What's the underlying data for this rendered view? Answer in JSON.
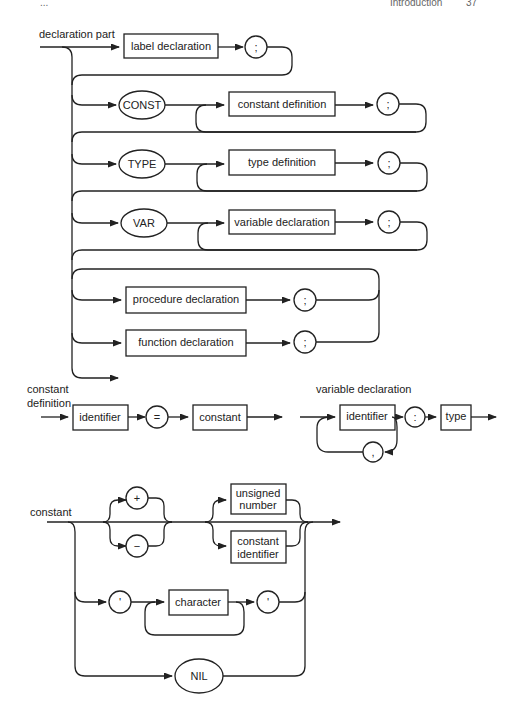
{
  "header": {
    "left": "...",
    "right_title": "Introduction",
    "page": "37"
  },
  "declaration_part": {
    "title": "declaration part",
    "label_declaration": "label declaration",
    "semicolon": ";",
    "const_kw": "CONST",
    "constant_definition": "constant definition",
    "type_kw": "TYPE",
    "type_definition": "type definition",
    "var_kw": "VAR",
    "variable_declaration": "variable declaration",
    "procedure_declaration": "procedure declaration",
    "function_declaration": "function declaration"
  },
  "constant_definition": {
    "title_line1": "constant",
    "title_line2": "definition",
    "identifier": "identifier",
    "equals": "=",
    "constant": "constant"
  },
  "variable_declaration": {
    "title": "variable declaration",
    "identifier": "identifier",
    "colon": ":",
    "comma": ",",
    "type": "type"
  },
  "constant": {
    "title": "constant",
    "plus": "+",
    "minus": "−",
    "unsigned_number_l1": "unsigned",
    "unsigned_number_l2": "number",
    "constant_identifier_l1": "constant",
    "constant_identifier_l2": "identifier",
    "quote": "'",
    "character": "character",
    "nil_kw": "NIL"
  }
}
